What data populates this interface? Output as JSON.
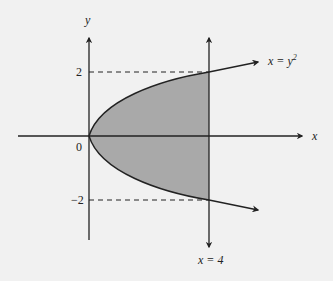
{
  "diagram": {
    "type": "region-between-curves",
    "axes": {
      "x_label": "x",
      "y_label": "y",
      "origin_label": "0"
    },
    "y_ticks": [
      {
        "value": 2,
        "label": "2"
      },
      {
        "value": -2,
        "label": "−2"
      }
    ],
    "curves": [
      {
        "name": "parabola",
        "equation": "x = y²",
        "label_main": "x = y",
        "label_sup": "2"
      },
      {
        "name": "vertical-line",
        "equation": "x = 4",
        "label": "x = 4"
      }
    ],
    "shaded_region": {
      "description": "region bounded by x = y² and x = 4, y from -2 to 2",
      "fill": "#a9a9a9"
    },
    "colors": {
      "background": "#f1f1f1",
      "stroke": "#222222",
      "shade": "#a9a9a9"
    }
  }
}
